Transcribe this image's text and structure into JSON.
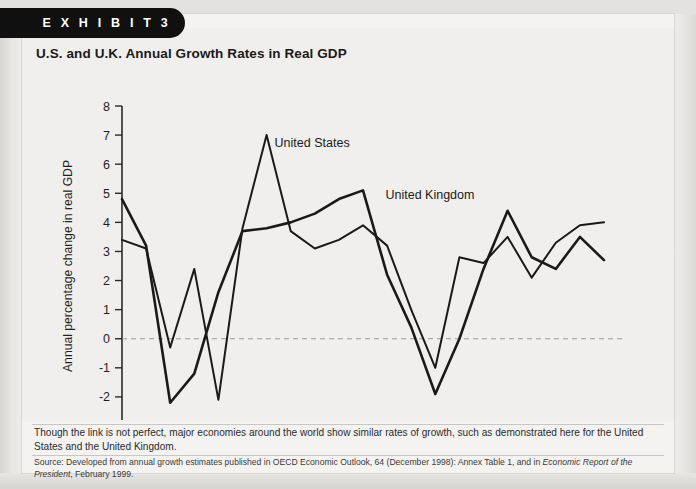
{
  "exhibit": {
    "banner_label": "E X H I B I T   3",
    "title": "U.S. and U.K. Annual Growth Rates in Real GDP"
  },
  "caption": {
    "body": "Though the link is not perfect, major economies around the world show similar rates of growth, such as demonstrated here for the United States and the United Kingdom.",
    "source_prefix": "Source: Developed from annual growth estimates published in OECD Economic Outlook, 64 (December 1998): Annex Table 1, and in ",
    "source_italic_1": "Economic Report of the President",
    "source_suffix": ", February 1999."
  },
  "chart_data": {
    "type": "line",
    "title": "U.S. and U.K. Annual Growth Rates in Real GDP",
    "xlabel": "",
    "ylabel": "Annual percentage change in real GDP",
    "xlim": [
      1978,
      1998
    ],
    "ylim": [
      -3,
      8
    ],
    "ytick_step": 1,
    "yticks": [
      8,
      7,
      6,
      5,
      4,
      3,
      2,
      1,
      0,
      -1,
      -2,
      -3
    ],
    "xticks_minor_step": 1,
    "xtick_labels": [
      "1978",
      "1980",
      "1982",
      "1984",
      "1986",
      "1988",
      "1990",
      "1992",
      "1994",
      "1996",
      "1998"
    ],
    "xtick_label_years": [
      1978,
      1980,
      1982,
      1984,
      1986,
      1988,
      1990,
      1992,
      1994,
      1996,
      1998
    ],
    "grid": false,
    "zero_line": true,
    "zero_line_style": "dashed",
    "legend_position": "inline-annotation",
    "x": [
      1978,
      1979,
      1980,
      1981,
      1982,
      1983,
      1984,
      1985,
      1986,
      1987,
      1988,
      1989,
      1990,
      1991,
      1992,
      1993,
      1994,
      1995,
      1996,
      1997,
      1998
    ],
    "series": [
      {
        "name": "United States",
        "label": "United States",
        "color": "#1a1a1a",
        "label_x": 1984.0,
        "label_y": 6.6,
        "values": [
          3.4,
          3.1,
          -0.3,
          2.4,
          -2.1,
          3.8,
          7.0,
          3.7,
          3.1,
          3.4,
          3.9,
          3.2,
          1.0,
          -1.0,
          2.8,
          2.6,
          3.5,
          2.1,
          3.3,
          3.9,
          4.0
        ]
      },
      {
        "name": "United Kingdom",
        "label": "United Kingdom",
        "color": "#1a1a1a",
        "label_x": 1988.6,
        "label_y": 4.8,
        "values": [
          4.8,
          3.2,
          -2.2,
          -1.2,
          1.6,
          3.7,
          3.8,
          4.0,
          4.3,
          4.8,
          5.1,
          2.2,
          0.4,
          -1.9,
          0.0,
          2.4,
          4.4,
          2.8,
          2.4,
          3.5,
          2.7
        ]
      }
    ]
  }
}
